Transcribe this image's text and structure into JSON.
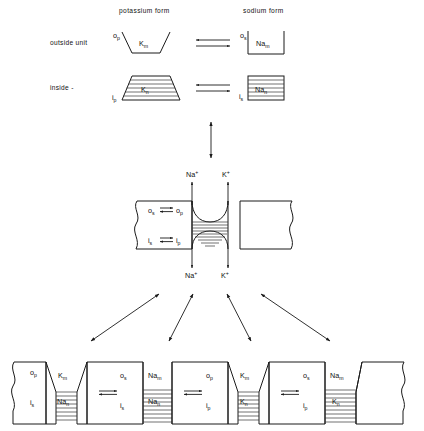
{
  "figure": {
    "background_color": "#ffffff",
    "ink_color": "#1a1a1a"
  },
  "top_panel": {
    "column_headers": [
      {
        "id": "potassium",
        "label": "potassium  form"
      },
      {
        "id": "sodium",
        "label": "sodium  form"
      }
    ],
    "row_labels": [
      {
        "id": "outside",
        "label": "outside  unit"
      },
      {
        "id": "inside",
        "label": "inside     -"
      }
    ],
    "units": [
      {
        "id": "outside-potassium",
        "shape": "trapezoid-open-top-narrow-bottom",
        "hatched": false,
        "corner_label_base": "o",
        "corner_label_sub": "p",
        "center_label_base": "K",
        "center_label_sub": "m"
      },
      {
        "id": "outside-sodium",
        "shape": "rectangle-open-top",
        "hatched": false,
        "corner_label_base": "o",
        "corner_label_sub": "s",
        "center_label_base": "Na",
        "center_label_sub": "m"
      },
      {
        "id": "inside-potassium",
        "shape": "trapezoid-wide-bottom",
        "hatched": true,
        "corner_label_base": "i",
        "corner_label_sub": "p",
        "center_label_base": "K",
        "center_label_sub": "n"
      },
      {
        "id": "inside-sodium",
        "shape": "rectangle",
        "hatched": true,
        "corner_label_base": "i",
        "corner_label_sub": "s",
        "center_label_base": "Na",
        "center_label_sub": "n"
      }
    ],
    "equilibrium_arrows": [
      {
        "id": "outside-equilibrium",
        "type": "double-horizontal"
      },
      {
        "id": "inside-equilibrium",
        "type": "double-horizontal"
      }
    ]
  },
  "connector_arrow": {
    "id": "top-to-middle",
    "type": "double-headed-vertical"
  },
  "middle_panel": {
    "id": "membrane-channel",
    "membrane_style": "slab-with-wavy-ends",
    "ion_labels_top": [
      {
        "base": "Na",
        "sup": "+",
        "direction": "up"
      },
      {
        "base": "K",
        "sup": "+",
        "direction": "up"
      }
    ],
    "ion_labels_bottom": [
      {
        "base": "Na",
        "sup": "+",
        "direction": "down"
      },
      {
        "base": "K",
        "sup": "+",
        "direction": "down"
      }
    ],
    "interior_equilibria": [
      {
        "left_base": "o",
        "left_sub": "s",
        "right_base": "o",
        "right_sub": "p",
        "arrow": "double-horizontal"
      },
      {
        "left_base": "i",
        "left_sub": "s",
        "right_base": "i",
        "right_sub": "p",
        "arrow": "double-horizontal"
      }
    ],
    "channel_description": "hourglass pore with hatched central band"
  },
  "fan_arrows": [
    {
      "id": "fan-arrow-far-left",
      "type": "double-headed-diagonal"
    },
    {
      "id": "fan-arrow-left",
      "type": "double-headed-diagonal"
    },
    {
      "id": "fan-arrow-right",
      "type": "double-headed-diagonal"
    },
    {
      "id": "fan-arrow-far-right",
      "type": "double-headed-diagonal"
    }
  ],
  "bottom_panel": {
    "id": "membrane-strip",
    "description": "linear strip of alternating carrier units and channels",
    "end_style": "wavy-break",
    "cells": [
      {
        "id": "cell-1",
        "type": "unit",
        "upper_base": "o",
        "upper_sub": "p",
        "lower_base": "i",
        "lower_sub": "s",
        "has_internal_arrow": false,
        "left_edge": "wavy"
      },
      {
        "id": "channel-1",
        "type": "channel",
        "upper_base": "K",
        "upper_sub": "m",
        "lower_base": "Na",
        "lower_sub": "n",
        "taper": "narrow-top"
      },
      {
        "id": "cell-2",
        "type": "unit",
        "upper_base": "o",
        "upper_sub": "s",
        "lower_base": "i",
        "lower_sub": "s",
        "has_internal_arrow": true,
        "left_edge": "straight"
      },
      {
        "id": "channel-2",
        "type": "channel",
        "upper_base": "Na",
        "upper_sub": "m",
        "lower_base": "Na",
        "lower_sub": "n",
        "taper": "straight"
      },
      {
        "id": "cell-3",
        "type": "unit",
        "upper_base": "o",
        "upper_sub": "p",
        "lower_base": "i",
        "lower_sub": "p",
        "has_internal_arrow": true,
        "left_edge": "straight"
      },
      {
        "id": "channel-3",
        "type": "channel",
        "upper_base": "K",
        "upper_sub": "m",
        "lower_base": "K",
        "lower_sub": "n",
        "taper": "narrow-top"
      },
      {
        "id": "cell-4",
        "type": "unit",
        "upper_base": "o",
        "upper_sub": "s",
        "lower_base": "i",
        "lower_sub": "p",
        "has_internal_arrow": true,
        "left_edge": "straight"
      },
      {
        "id": "channel-4",
        "type": "channel",
        "upper_base": "Na",
        "upper_sub": "m",
        "lower_base": "K",
        "lower_sub": "n",
        "taper": "straight"
      },
      {
        "id": "cell-5",
        "type": "unit-end",
        "upper_base": "",
        "upper_sub": "",
        "lower_base": "",
        "lower_sub": "",
        "has_internal_arrow": false,
        "left_edge": "straight",
        "right_edge": "wavy"
      }
    ]
  }
}
